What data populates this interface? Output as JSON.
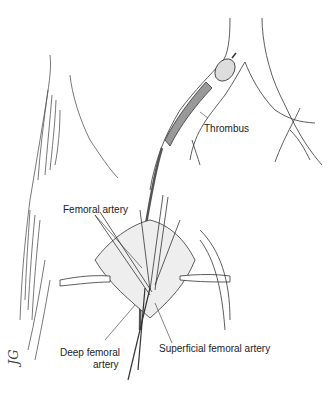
{
  "figure": {
    "type": "surgical illustration",
    "labels": {
      "thrombus": "Thrombus",
      "femoral_artery": "Femoral artery",
      "deep_femoral_artery_line1": "Deep femoral",
      "deep_femoral_artery_line2": "artery",
      "superficial_femoral_artery": "Superficial femoral artery"
    },
    "signature": "JG"
  }
}
